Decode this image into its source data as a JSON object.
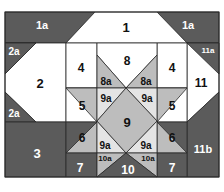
{
  "diagram": {
    "colors": {
      "dark": "#5b5b5b",
      "medium": "#bdbdbd",
      "light": "#e4e4e4",
      "white": "#ffffff",
      "line": "#2a2a2a"
    },
    "labels": {
      "p1": "1",
      "p1a_left": "1a",
      "p1a_right": "1a",
      "p2": "2",
      "p2a_top": "2a",
      "p2a_bottom": "2a",
      "p3": "3",
      "p4_left": "4",
      "p4_right": "4",
      "p5_left": "5",
      "p5_right": "5",
      "p6_left": "6",
      "p6_right": "6",
      "p7_left": "7",
      "p7_right": "7",
      "p8": "8",
      "p8a_left": "8a",
      "p8a_right": "8a",
      "p9": "9",
      "p9a_tl": "9a",
      "p9a_tr": "9a",
      "p9a_bl": "9a",
      "p9a_br": "9a",
      "p10": "10",
      "p10a_left": "10a",
      "p10a_right": "10a",
      "p11": "11",
      "p11a": "11a",
      "p11b": "11b"
    }
  }
}
